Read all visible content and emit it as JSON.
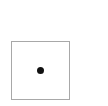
{
  "die": {
    "face_value": 1,
    "pip_count": 1,
    "border_color": "#a8a8a8",
    "pip_color": "#111111",
    "background_color": "#ffffff"
  }
}
